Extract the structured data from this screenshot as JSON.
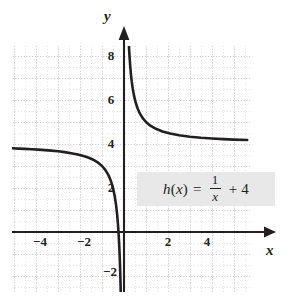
{
  "figure": {
    "kind": "cartesian-graph",
    "background_color": "#ffffff",
    "ink_color": "#231f20",
    "grid_color": "#c9c9c9",
    "equation_box_color": "#e8e8e8"
  },
  "equation": {
    "function_name": "h",
    "argument": "x",
    "lhs": "h(x)",
    "equals": "=",
    "numerator": "1",
    "denominator": "x",
    "plus": "+",
    "constant": "4",
    "full_text": "h(x) = 1/x + 4"
  },
  "axes": {
    "x_label": "x",
    "y_label": "y",
    "x_ticks": [
      {
        "value": -4,
        "label": "−4"
      },
      {
        "value": -2,
        "label": "−2"
      },
      {
        "value": 2,
        "label": "2"
      },
      {
        "value": 4,
        "label": "4"
      }
    ],
    "y_ticks": [
      {
        "value": -2,
        "label": "−2"
      },
      {
        "value": 2,
        "label": "2"
      },
      {
        "value": 4,
        "label": "4"
      },
      {
        "value": 6,
        "label": "6"
      },
      {
        "value": 8,
        "label": "8"
      }
    ]
  },
  "chart_data": {
    "type": "line",
    "title": "",
    "subtitle": "",
    "xlabel": "x",
    "ylabel": "y",
    "xlim": [
      -5.1,
      5.7
    ],
    "ylim": [
      -2.9,
      9.2
    ],
    "grid": true,
    "grid_major_step": 2,
    "grid_minor_step": 1,
    "legend": "none",
    "annotations": [
      {
        "text": "h(x) = 1/x + 4",
        "x": 1.2,
        "y": 2.8
      }
    ],
    "asymptotes": [
      {
        "type": "vertical",
        "x": 0
      },
      {
        "type": "horizontal",
        "y": 4
      }
    ],
    "series": [
      {
        "name": "h(x) = 1/x + 4 (left branch, x < 0)",
        "x": [
          -5.1,
          -4.8,
          -4.5,
          -4.2,
          -3.9,
          -3.6,
          -3.3,
          -3.0,
          -2.7,
          -2.4,
          -2.1,
          -1.8,
          -1.6,
          -1.4,
          -1.2,
          -1.0,
          -0.85,
          -0.7,
          -0.6,
          -0.5,
          -0.42,
          -0.36,
          -0.31,
          -0.27,
          -0.24,
          -0.21,
          -0.19,
          -0.17,
          -0.155,
          -0.145
        ],
        "y": [
          3.804,
          3.792,
          3.778,
          3.762,
          3.744,
          3.722,
          3.697,
          3.667,
          3.63,
          3.583,
          3.524,
          3.444,
          3.375,
          3.286,
          3.167,
          3.0,
          2.824,
          2.571,
          2.333,
          2.0,
          1.619,
          1.222,
          0.774,
          0.296,
          -0.167,
          -0.762,
          -1.263,
          -1.882,
          -2.452,
          -2.897
        ]
      },
      {
        "name": "h(x) = 1/x + 4 (right branch, x > 0)",
        "x": [
          0.193,
          0.21,
          0.23,
          0.25,
          0.28,
          0.31,
          0.35,
          0.4,
          0.46,
          0.53,
          0.62,
          0.72,
          0.85,
          1.0,
          1.2,
          1.45,
          1.75,
          2.1,
          2.5,
          3.0,
          3.5,
          4.0,
          4.5,
          5.0,
          5.6
        ],
        "y": [
          9.181,
          8.762,
          8.348,
          8.0,
          7.571,
          7.226,
          6.857,
          6.5,
          6.174,
          5.887,
          5.613,
          5.389,
          5.176,
          5.0,
          4.833,
          4.69,
          4.571,
          4.476,
          4.4,
          4.333,
          4.286,
          4.25,
          4.222,
          4.2,
          4.179
        ]
      }
    ]
  }
}
